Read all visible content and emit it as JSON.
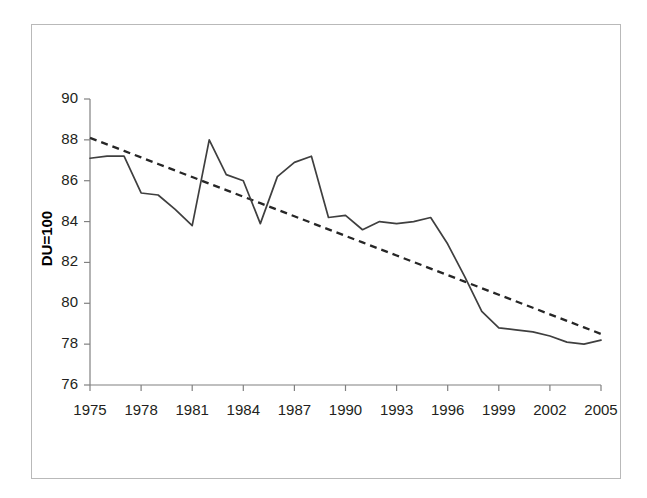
{
  "chart_data": {
    "type": "line",
    "title": "",
    "subtitle": "",
    "xlabel": "",
    "ylabel": "DU=100",
    "xlim": [
      1975,
      2005
    ],
    "ylim": [
      76,
      90
    ],
    "grid": false,
    "legend": "none",
    "x_tick_labels": [
      "1975",
      "1978",
      "1981",
      "1984",
      "1987",
      "1990",
      "1993",
      "1996",
      "1999",
      "2002",
      "2005"
    ],
    "x_tick_values": [
      1975,
      1978,
      1981,
      1984,
      1987,
      1990,
      1993,
      1996,
      1999,
      2002,
      2005
    ],
    "y_tick_labels": [
      "76",
      "78",
      "80",
      "82",
      "84",
      "86",
      "88",
      "90"
    ],
    "y_tick_values": [
      76,
      78,
      80,
      82,
      84,
      86,
      88,
      90
    ],
    "x": [
      1975,
      1976,
      1977,
      1978,
      1979,
      1980,
      1981,
      1982,
      1983,
      1984,
      1985,
      1986,
      1987,
      1988,
      1989,
      1990,
      1991,
      1992,
      1993,
      1994,
      1995,
      1996,
      1997,
      1998,
      1999,
      2000,
      2001,
      2002,
      2003,
      2004,
      2005
    ],
    "series": [
      {
        "name": "DU=100 index",
        "style": "solid",
        "color": "#3f3f3f",
        "values": [
          87.1,
          87.2,
          87.2,
          85.4,
          85.3,
          84.6,
          83.8,
          88.0,
          86.3,
          86.0,
          83.9,
          86.2,
          86.9,
          87.2,
          84.2,
          84.3,
          83.6,
          84.0,
          83.9,
          84.0,
          84.2,
          82.9,
          81.3,
          79.6,
          78.8,
          78.7,
          78.6,
          78.4,
          78.1,
          78.0,
          78.2
        ]
      },
      {
        "name": "Linear trend",
        "style": "dashed",
        "color": "#262626",
        "values": [
          88.1,
          87.78,
          87.46,
          87.14,
          86.82,
          86.5,
          86.18,
          85.86,
          85.54,
          85.22,
          84.9,
          84.58,
          84.26,
          83.94,
          83.62,
          83.3,
          82.98,
          82.66,
          82.34,
          82.02,
          81.7,
          81.38,
          81.06,
          80.74,
          80.42,
          80.1,
          79.78,
          79.46,
          79.14,
          78.82,
          78.5
        ]
      }
    ]
  },
  "colors": {
    "frame": "#b9b9b9",
    "axis": "#808080",
    "tick_text": "#231f20",
    "series_line": "#3f3f3f",
    "trend_line": "#262626",
    "background": "#ffffff"
  },
  "axis_title": {
    "y": "DU=100"
  }
}
